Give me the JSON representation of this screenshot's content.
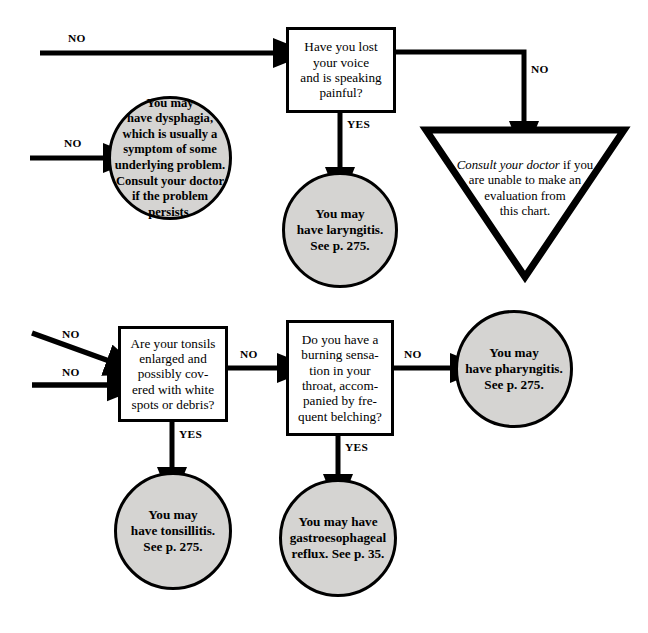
{
  "chart": {
    "accent_fill": "#d5d4d2",
    "stroke": "#000000",
    "background": "#ffffff"
  },
  "nodes": {
    "q_voice": {
      "shape": "decision-box",
      "text": "Have you lost\nyour voice\nand is speaking\npainful?"
    },
    "r_dysphagia": {
      "shape": "outcome-circle",
      "text": "You may\nhave dysphagia,\nwhich is usually a\nsymptom of some\nunderlying problem.\nConsult your doctor\nif the problem\npersists."
    },
    "r_laryngitis": {
      "shape": "outcome-circle",
      "text": "You may\nhave laryngitis.\nSee p. 275."
    },
    "r_consult": {
      "shape": "triangle",
      "text_italic": "Consult your doctor",
      "text_rest": " if you\nare unable to make an\nevaluation from\nthis chart."
    },
    "q_tonsils": {
      "shape": "decision-box",
      "text": "Are your tonsils\nenlarged and\npossibly cov-\nered with white\nspots or debris?"
    },
    "q_burning": {
      "shape": "decision-box",
      "text": "Do you have a\nburning sensa-\ntion in your\nthroat, accom-\npanied by fre-\nquent belching?"
    },
    "r_pharyngitis": {
      "shape": "outcome-circle",
      "text": "You may\nhave pharyngitis.\nSee p. 275."
    },
    "r_tonsillitis": {
      "shape": "outcome-circle",
      "text": "You may\nhave tonsillitis.\nSee p. 275."
    },
    "r_reflux": {
      "shape": "outcome-circle",
      "text": "You may have\ngastroesophageal\nreflux. See p. 35."
    }
  },
  "edges": [
    {
      "id": "e1",
      "label": "NO",
      "from": "entry-top",
      "to": "q_voice"
    },
    {
      "id": "e2",
      "label": "NO",
      "from": "entry-left",
      "to": "r_dysphagia"
    },
    {
      "id": "e3",
      "label": "YES",
      "from": "q_voice",
      "to": "r_laryngitis"
    },
    {
      "id": "e4",
      "label": "NO",
      "from": "q_voice",
      "to": "r_consult"
    },
    {
      "id": "e5",
      "label": "NO",
      "from": "entry-lower-a",
      "to": "q_tonsils"
    },
    {
      "id": "e6",
      "label": "NO",
      "from": "entry-lower-b",
      "to": "q_tonsils"
    },
    {
      "id": "e7",
      "label": "NO",
      "from": "q_tonsils",
      "to": "q_burning"
    },
    {
      "id": "e8",
      "label": "NO",
      "from": "q_burning",
      "to": "r_pharyngitis"
    },
    {
      "id": "e9",
      "label": "YES",
      "from": "q_tonsils",
      "to": "r_tonsillitis"
    },
    {
      "id": "e10",
      "label": "YES",
      "from": "q_burning",
      "to": "r_reflux"
    }
  ]
}
